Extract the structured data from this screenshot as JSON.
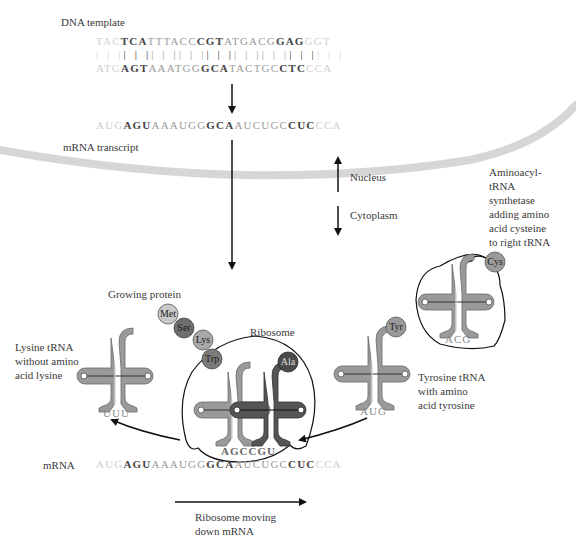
{
  "labels": {
    "dna_template": "DNA template",
    "mrna_transcript": "mRNA transcript",
    "nucleus": "Nucleus",
    "cytoplasm": "Cytoplasm",
    "synthetase": [
      "Aminoacyl-",
      "tRNA",
      "synthetase",
      "adding amino",
      "acid cysteine",
      "to right tRNA"
    ],
    "growing_protein": "Growing protein",
    "ribosome": "Ribosome",
    "lysine_trna": [
      "Lysine tRNA",
      "without amino",
      "acid lysine"
    ],
    "tyrosine_trna": [
      "Tyrosine tRNA",
      "with amino",
      "acid tyrosine"
    ],
    "mrna": "mRNA",
    "ribosome_moving": [
      "Ribosome moving",
      "down mRNA"
    ]
  },
  "dna": {
    "top_strand": [
      {
        "t": "TAC",
        "s": "faint"
      },
      {
        "t": "TCA",
        "s": "bold"
      },
      {
        "t": "TTT",
        "s": "normal"
      },
      {
        "t": "ACC",
        "s": "normal"
      },
      {
        "t": "CGT",
        "s": "bold"
      },
      {
        "t": "ATG",
        "s": "normal"
      },
      {
        "t": "ACG",
        "s": "normal"
      },
      {
        "t": "GAG",
        "s": "bold"
      },
      {
        "t": "GGT",
        "s": "faint"
      }
    ],
    "bottom_strand": [
      {
        "t": "ATG",
        "s": "faint"
      },
      {
        "t": "AGT",
        "s": "bold"
      },
      {
        "t": "AAA",
        "s": "normal"
      },
      {
        "t": "TGG",
        "s": "normal"
      },
      {
        "t": "GCA",
        "s": "bold"
      },
      {
        "t": "TAC",
        "s": "normal"
      },
      {
        "t": "TGC",
        "s": "normal"
      },
      {
        "t": "CTC",
        "s": "bold"
      },
      {
        "t": "CCA",
        "s": "faint"
      }
    ]
  },
  "mrna_transcript": [
    {
      "t": "AUG",
      "s": "faint"
    },
    {
      "t": "AGU",
      "s": "bold"
    },
    {
      "t": "AAA",
      "s": "normal"
    },
    {
      "t": "UGG",
      "s": "normal"
    },
    {
      "t": "GCA",
      "s": "bold"
    },
    {
      "t": "AUC",
      "s": "normal"
    },
    {
      "t": "UGC",
      "s": "normal"
    },
    {
      "t": "CUC",
      "s": "bold"
    },
    {
      "t": "CCA",
      "s": "faint"
    }
  ],
  "mrna_bottom": [
    {
      "t": "AUG",
      "s": "faint"
    },
    {
      "t": "AGU",
      "s": "bold"
    },
    {
      "t": "AAA",
      "s": "normal"
    },
    {
      "t": "UGG",
      "s": "normal"
    },
    {
      "t": "GCA",
      "s": "bold"
    },
    {
      "t": "AUC",
      "s": "normal"
    },
    {
      "t": "UGC",
      "s": "normal"
    },
    {
      "t": "CUC",
      "s": "bold"
    },
    {
      "t": "CCA",
      "s": "faint"
    }
  ],
  "anticodons": {
    "lysine": "UUU",
    "ribosome_pair": "AGCCGU",
    "tyrosine": "AUG",
    "cysteine": "ACG"
  },
  "amino_acids": {
    "chain": [
      {
        "name": "Met",
        "color": "#c8c8c8"
      },
      {
        "name": "Ser",
        "color": "#6e6e6e"
      },
      {
        "name": "Lys",
        "color": "#a8a8a8"
      },
      {
        "name": "Trp",
        "color": "#7a7a7a"
      }
    ],
    "ala": {
      "name": "Ala",
      "color": "#4a4a4a"
    },
    "tyr": {
      "name": "Tyr",
      "color": "#9a9a9a"
    },
    "cys": {
      "name": "Cys",
      "color": "#9a9a9a"
    }
  },
  "colors": {
    "trna_fill": "#9a9a9a",
    "trna_dark": "#555555",
    "membrane": "#d6d6d6",
    "arrow": "#111111"
  }
}
